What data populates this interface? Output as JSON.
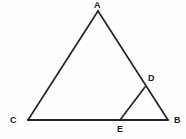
{
  "figure": {
    "kind": "geometry-diagram",
    "width": 186,
    "height": 139,
    "background_color": "#fefefe",
    "stroke_color": "#262626",
    "label_color": "#1a1a1a",
    "stroke_width": 1.6
  },
  "points": {
    "A": {
      "label": "A",
      "x": 98,
      "y": 11
    },
    "B": {
      "label": "B",
      "x": 168,
      "y": 120
    },
    "C": {
      "label": "C",
      "x": 28,
      "y": 120
    },
    "D": {
      "label": "D",
      "x": 145,
      "y": 87
    },
    "E": {
      "label": "E",
      "x": 120,
      "y": 120
    }
  },
  "segments": [
    {
      "name": "CA",
      "from": "C",
      "to": "A"
    },
    {
      "name": "AB",
      "from": "A",
      "to": "B"
    },
    {
      "name": "CB",
      "from": "C",
      "to": "B"
    },
    {
      "name": "ED",
      "from": "E",
      "to": "D"
    }
  ],
  "labels": {
    "A": "A",
    "B": "B",
    "C": "C",
    "D": "D",
    "E": "E"
  }
}
